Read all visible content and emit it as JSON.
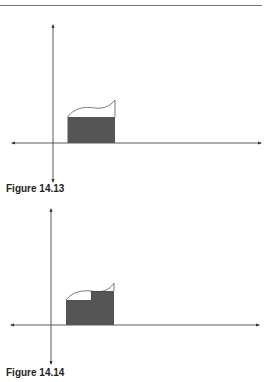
{
  "figures": [
    {
      "caption": "Figure 14.13",
      "description": "Area under a curve approximated by a single rectangle"
    },
    {
      "caption": "Figure 14.14",
      "description": "Area under a curve approximated by two rectangles"
    }
  ],
  "colors": {
    "fill": "#555555",
    "axis": "#333333",
    "rule": "#777777"
  }
}
